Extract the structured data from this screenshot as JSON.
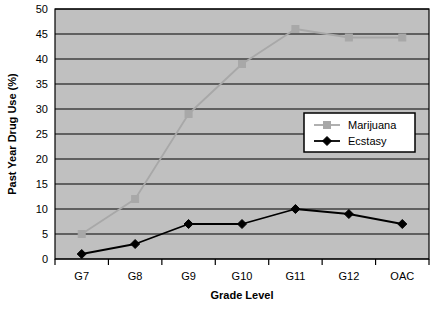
{
  "chart_data": {
    "type": "line",
    "title": "",
    "xlabel": "Grade Level",
    "ylabel": "Past Year Drug Use (%)",
    "categories": [
      "G7",
      "G8",
      "G9",
      "G10",
      "G11",
      "G12",
      "OAC"
    ],
    "ylim": [
      0,
      50
    ],
    "ytick_step": 5,
    "yticks": [
      "0",
      "5",
      "10",
      "15",
      "20",
      "25",
      "30",
      "35",
      "40",
      "45",
      "50"
    ],
    "grid": "horizontal",
    "legend_position": "inside-right-middle",
    "plot_background": "#c0c0c0",
    "series": [
      {
        "name": "Marijuana",
        "color": "#a8a8a8",
        "marker": "square",
        "values": [
          5,
          12,
          29,
          39,
          46,
          44.3,
          44.3
        ]
      },
      {
        "name": "Ecstasy",
        "color": "#000000",
        "marker": "diamond",
        "values": [
          1,
          3,
          7,
          7,
          10,
          9,
          7
        ]
      }
    ]
  },
  "legend": {
    "entries": [
      {
        "label": "Marijuana"
      },
      {
        "label": "Ecstasy"
      }
    ]
  }
}
